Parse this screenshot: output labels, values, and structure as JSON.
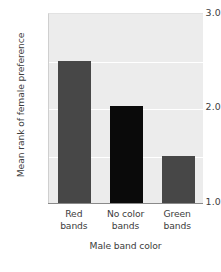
{
  "chart_data": {
    "type": "bar",
    "title": "",
    "xlabel": "Male band color",
    "ylabel": "Mean rank of female preference",
    "categories": [
      "Red bands",
      "No color bands",
      "Green bands"
    ],
    "category_lines": [
      {
        "line1": "Red",
        "line2": "bands"
      },
      {
        "line1": "No color",
        "line2": "bands"
      },
      {
        "line1": "Green",
        "line2": "bands"
      }
    ],
    "values": [
      2.5,
      2.02,
      1.49
    ],
    "bar_colors": [
      "#474747",
      "#0a0a0a",
      "#474747"
    ],
    "ylim": [
      1.0,
      3.0
    ],
    "yticks": [
      "3.0",
      "2.0",
      "1.0"
    ],
    "ytick_values": [
      3.0,
      2.0,
      1.0
    ],
    "gridlines": [
      2.5,
      2.0,
      1.5
    ],
    "grid": true,
    "grid_color": "#ffffff",
    "legend": null,
    "plot_background": "#ececec",
    "figure_background": "#ffffff",
    "axis_color": "#8a8a8a",
    "text_color": "#3d3d3d"
  }
}
